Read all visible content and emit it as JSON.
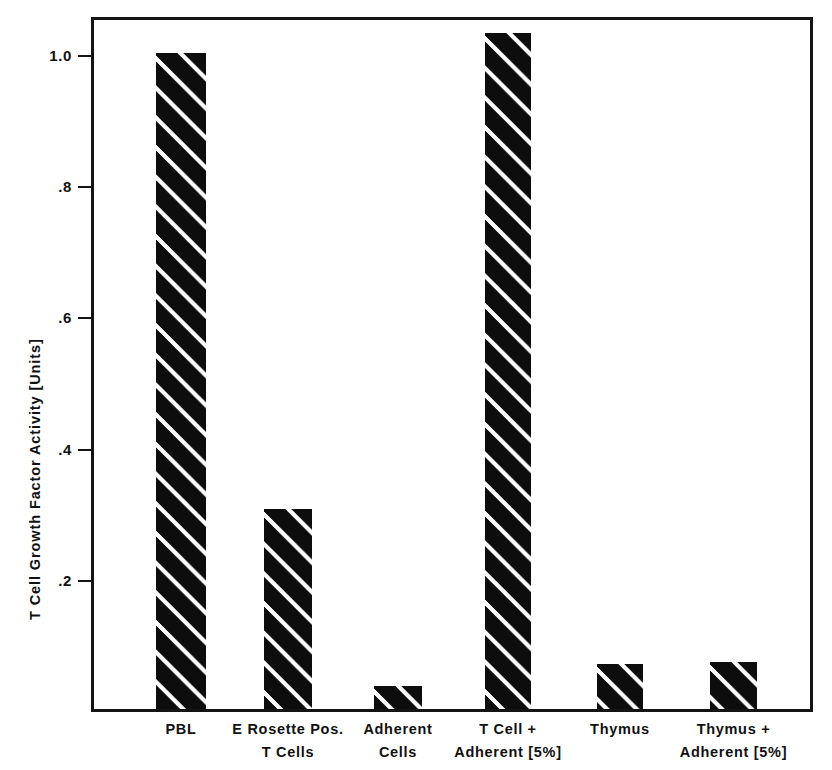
{
  "chart_data": {
    "type": "bar",
    "title": "",
    "xlabel": "",
    "ylabel": "T Cell Growth Factor Activity [Units]",
    "categories": [
      "PBL",
      "E Rosette Pos.\nT Cells",
      "Adherent\nCells",
      "T Cell +\nAdherent [5%]",
      "Thymus",
      "Thymus +\nAdherent [5%]"
    ],
    "values": [
      1.0,
      0.305,
      0.035,
      1.03,
      0.068,
      0.072
    ],
    "ylim": [
      0,
      1.085
    ],
    "yticks": [
      0.2,
      0.4,
      0.6,
      0.8,
      1.0
    ],
    "ytick_labels": [
      ".2",
      ".4",
      ".6",
      ".8",
      "1.0"
    ],
    "grid": false,
    "legend": null,
    "bar_fill": "black-diagonal-hatch",
    "colors": {
      "bar": "#0d0d0d",
      "hatch": "#ffffff",
      "axis": "#141414",
      "text": "#111111",
      "background": "#ffffff"
    }
  }
}
